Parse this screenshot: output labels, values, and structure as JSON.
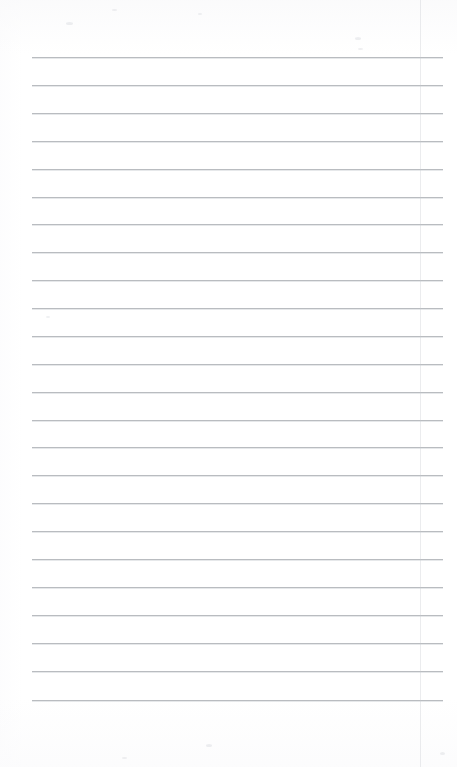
{
  "document": {
    "kind": "lined-notebook-page",
    "title": "Lined Paper Page",
    "content_text": "",
    "page_width": 457,
    "page_height": 767,
    "background_color": "#ffffff",
    "paper_tint_color": "#fcfcfd"
  },
  "ruling": {
    "rule_color": "#b9bcc0",
    "rule_shadow_color": "#d2d5d9",
    "rule_thickness_px": 1,
    "rule_count": 24,
    "first_rule_y": 57,
    "line_spacing_px": 27.9,
    "rule_left_x": 32,
    "rule_right_x": 443,
    "rule_width_px": 411,
    "top_margin_px": 57,
    "bottom_margin_px": 67,
    "rule_y_positions": [
      57,
      85,
      113,
      141,
      169,
      197,
      224,
      252,
      280,
      308,
      336,
      364,
      392,
      420,
      447,
      475,
      503,
      531,
      559,
      587,
      615,
      643,
      671,
      700
    ]
  },
  "margin_rule": {
    "enabled": true,
    "color": "#c4c8ce",
    "x": 420,
    "y_start": 0,
    "y_end": 767,
    "thickness_px": 1,
    "opacity": 0.34
  },
  "specks": [
    {
      "x": 66,
      "y": 22,
      "w": 7,
      "h": 3
    },
    {
      "x": 112,
      "y": 9,
      "w": 5,
      "h": 2
    },
    {
      "x": 198,
      "y": 13,
      "w": 4,
      "h": 2
    },
    {
      "x": 355,
      "y": 37,
      "w": 6,
      "h": 3
    },
    {
      "x": 358,
      "y": 48,
      "w": 5,
      "h": 2
    },
    {
      "x": 46,
      "y": 316,
      "w": 4,
      "h": 2
    },
    {
      "x": 206,
      "y": 744,
      "w": 6,
      "h": 3
    },
    {
      "x": 122,
      "y": 757,
      "w": 5,
      "h": 2
    },
    {
      "x": 440,
      "y": 752,
      "w": 5,
      "h": 3
    }
  ],
  "annotations": {
    "has_text": false,
    "has_handwriting": false,
    "description_label": "Blank ruled paper"
  }
}
